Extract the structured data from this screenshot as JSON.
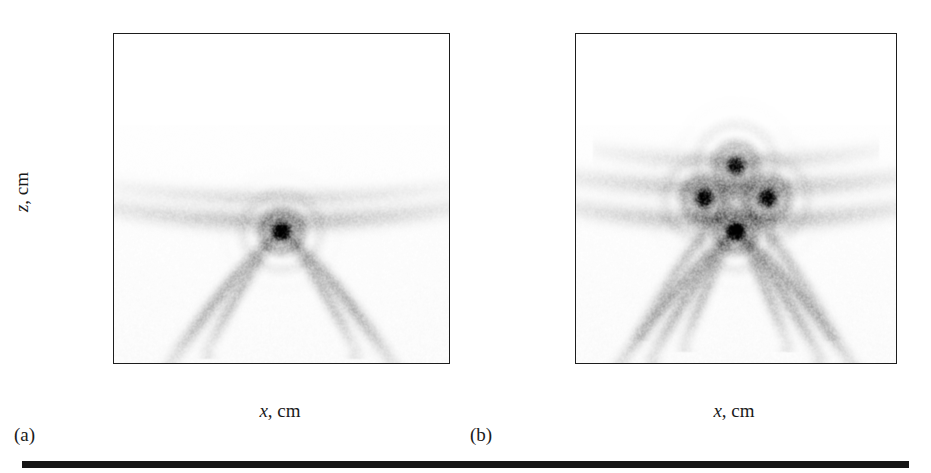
{
  "figure": {
    "panels": [
      {
        "tag": "(a)",
        "xlabel_var": "x",
        "xlabel_unit": ", cm",
        "ylabel_var": "z",
        "ylabel_unit": ", cm"
      },
      {
        "tag": "(b)",
        "xlabel_var": "x",
        "xlabel_unit": ", cm",
        "ylabel_var": "z",
        "ylabel_unit": ", cm"
      }
    ]
  },
  "chart_data": [
    {
      "type": "heatmap",
      "panel": "(a)",
      "title": "",
      "xlabel": "x, cm",
      "ylabel": "z, cm",
      "xlim": [
        -50,
        50
      ],
      "ylim": [
        100,
        0
      ],
      "y_inverted": true,
      "grid": false,
      "legend": null,
      "xticks": [
        -40,
        -20,
        0,
        20,
        40
      ],
      "xtick_labels": [
        "−40",
        "−20",
        "0",
        "20",
        "40"
      ],
      "yticks": [
        0,
        20,
        40,
        60,
        80,
        100
      ],
      "ytick_labels": [
        "0",
        "20",
        "40",
        "60",
        "80",
        "100"
      ],
      "colormap": "grayscale_inverted",
      "background_color": "#ffffff",
      "foreground_color": "#1d1d1d",
      "description": "Reconstructed acoustic image with a single bright focus and faint V-shaped side-lobe arcs converging on it.",
      "focal_spots": [
        {
          "x": 0,
          "z": 40,
          "intensity": 1.0,
          "radius_cm": 3.0
        }
      ],
      "arcs": [
        {
          "kind": "v-arc",
          "apex_x": 0,
          "apex_z": 40,
          "half_width_cm": 33,
          "top_z": 0,
          "intensity": 0.22,
          "thickness_cm": 2.6
        },
        {
          "kind": "v-arc",
          "apex_x": 0,
          "apex_z": 40,
          "half_width_cm": 22,
          "top_z": 4,
          "intensity": 0.18,
          "thickness_cm": 2.2
        },
        {
          "kind": "h-arc",
          "center_x": 0,
          "center_z": 47,
          "half_width_cm": 50,
          "sag_cm": 4,
          "intensity": 0.2,
          "thickness_cm": 3.0
        },
        {
          "kind": "h-arc",
          "center_x": 0,
          "center_z": 53,
          "half_width_cm": 46,
          "sag_cm": 3,
          "intensity": 0.11,
          "thickness_cm": 2.6
        }
      ]
    },
    {
      "type": "heatmap",
      "panel": "(b)",
      "title": "",
      "xlabel": "x, cm",
      "ylabel": "z, cm",
      "xlim": [
        -50,
        50
      ],
      "ylim": [
        100,
        0
      ],
      "y_inverted": true,
      "grid": false,
      "legend": null,
      "xticks": [
        -40,
        -20,
        0,
        20,
        40
      ],
      "xtick_labels": [
        "−40",
        "−20",
        "0",
        "20",
        "40"
      ],
      "yticks": [
        0,
        20,
        40,
        60,
        80,
        100
      ],
      "ytick_labels": [
        "0",
        "20",
        "40",
        "60",
        "80",
        "100"
      ],
      "colormap": "grayscale_inverted",
      "background_color": "#ffffff",
      "foreground_color": "#1d1d1d",
      "description": "Reconstructed acoustic image with four bright foci arranged in a diamond pattern and multiple nested V-shaped side-lobe arcs.",
      "focal_spots": [
        {
          "x": 0,
          "z": 40,
          "intensity": 1.0,
          "radius_cm": 3.0
        },
        {
          "x": -10,
          "z": 50,
          "intensity": 0.92,
          "radius_cm": 3.2
        },
        {
          "x": 10,
          "z": 50,
          "intensity": 0.92,
          "radius_cm": 3.2
        },
        {
          "x": 0,
          "z": 60,
          "intensity": 0.8,
          "radius_cm": 3.2
        }
      ],
      "arcs": [
        {
          "kind": "v-arc",
          "apex_x": 0,
          "apex_z": 40,
          "half_width_cm": 36,
          "top_z": 0,
          "intensity": 0.24,
          "thickness_cm": 2.6
        },
        {
          "kind": "v-arc",
          "apex_x": 0,
          "apex_z": 40,
          "half_width_cm": 26,
          "top_z": 2,
          "intensity": 0.22,
          "thickness_cm": 2.4
        },
        {
          "kind": "v-arc",
          "apex_x": 0,
          "apex_z": 40,
          "half_width_cm": 16,
          "top_z": 6,
          "intensity": 0.18,
          "thickness_cm": 2.2
        },
        {
          "kind": "v-arc",
          "apex_x": 0,
          "apex_z": 50,
          "half_width_cm": 30,
          "top_z": 10,
          "intensity": 0.16,
          "thickness_cm": 2.4
        },
        {
          "kind": "h-arc",
          "center_x": 0,
          "center_z": 47,
          "half_width_cm": 50,
          "sag_cm": 4,
          "intensity": 0.22,
          "thickness_cm": 3.0
        },
        {
          "kind": "h-arc",
          "center_x": 0,
          "center_z": 56,
          "half_width_cm": 48,
          "sag_cm": 3,
          "intensity": 0.2,
          "thickness_cm": 3.0
        },
        {
          "kind": "h-arc",
          "center_x": 0,
          "center_z": 64,
          "half_width_cm": 40,
          "sag_cm": 3,
          "intensity": 0.12,
          "thickness_cm": 2.8
        }
      ]
    }
  ]
}
